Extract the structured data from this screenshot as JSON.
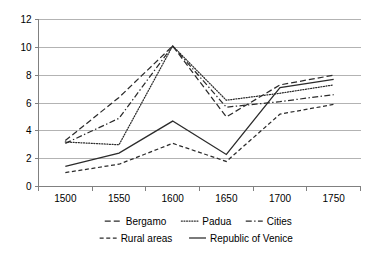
{
  "chart_data": {
    "type": "line",
    "title": "",
    "xlabel": "",
    "ylabel": "",
    "x": [
      1500,
      1550,
      1600,
      1650,
      1700,
      1750
    ],
    "categories": [
      "1500",
      "1550",
      "1600",
      "1650",
      "1700",
      "1750"
    ],
    "xlim": [
      1475,
      1775
    ],
    "ylim": [
      0,
      12
    ],
    "yticks": [
      0,
      2,
      4,
      6,
      8,
      10,
      12
    ],
    "ytick_labels": [
      "0",
      "2",
      "4",
      "6",
      "8",
      "10",
      "12"
    ],
    "xtick_labels": [
      "1500",
      "1550",
      "1600",
      "1650",
      "1700",
      "1750"
    ],
    "grid": true,
    "legend_position": "bottom",
    "series": [
      {
        "name": "Bergamo",
        "style": "dashed-long",
        "values": [
          3.3,
          6.4,
          10.1,
          5.0,
          7.3,
          8.0
        ]
      },
      {
        "name": "Padua",
        "style": "dotted",
        "values": [
          3.2,
          3.0,
          10.1,
          6.2,
          6.7,
          7.3
        ]
      },
      {
        "name": "Cities",
        "style": "dash-dot",
        "values": [
          3.1,
          4.9,
          10.1,
          5.7,
          6.1,
          6.6
        ]
      },
      {
        "name": "Rural areas",
        "style": "dashed-short",
        "values": [
          1.0,
          1.6,
          3.1,
          1.8,
          5.2,
          5.9
        ]
      },
      {
        "name": "Republic of Venice",
        "style": "solid",
        "values": [
          1.45,
          2.4,
          4.7,
          2.3,
          7.1,
          7.7
        ]
      }
    ]
  },
  "legend": {
    "items": [
      {
        "label": "Bergamo",
        "style": "dashed-long"
      },
      {
        "label": "Padua",
        "style": "dotted"
      },
      {
        "label": "Cities",
        "style": "dash-dot"
      },
      {
        "label": "Rural areas",
        "style": "dashed-short"
      },
      {
        "label": "Republic of Venice",
        "style": "solid"
      }
    ]
  },
  "colors": {
    "line": "#2b2b2b",
    "grid": "#b3b3b3",
    "axis": "#808080",
    "text": "#000000",
    "background": "#ffffff"
  }
}
